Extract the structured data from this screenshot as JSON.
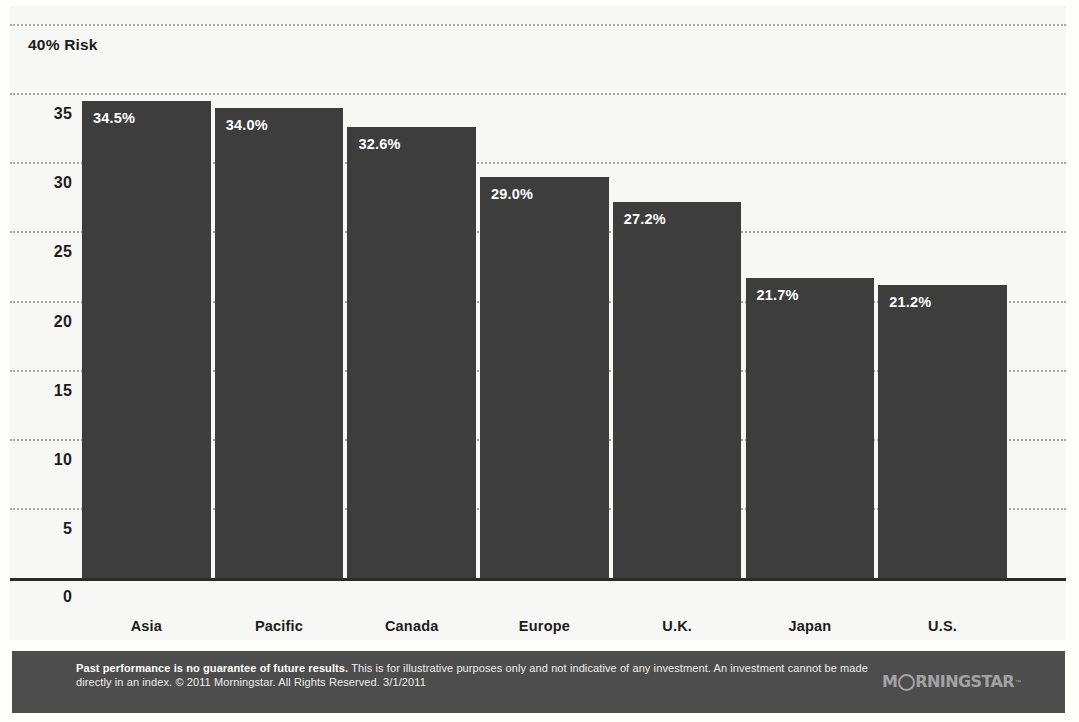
{
  "chart_data": {
    "type": "bar",
    "title": "",
    "subtitle": "",
    "axis_header_label": "40% Risk",
    "categories": [
      "Asia",
      "Pacific",
      "Canada",
      "Europe",
      "U.K.",
      "Japan",
      "U.S."
    ],
    "values": [
      34.5,
      34.0,
      32.6,
      29.0,
      27.2,
      21.7,
      21.2
    ],
    "value_labels": [
      "34.5%",
      "34.0%",
      "32.6%",
      "29.0%",
      "27.2%",
      "21.7%",
      "21.2%"
    ],
    "xlabel": "",
    "ylabel": "Risk",
    "ylim": [
      0,
      40
    ],
    "ytick_labels": [
      "0",
      "5",
      "10",
      "15",
      "20",
      "25",
      "30",
      "35"
    ],
    "ytick_values": [
      0,
      5,
      10,
      15,
      20,
      25,
      30,
      35
    ],
    "gridline_values": [
      5,
      10,
      15,
      20,
      25,
      30,
      35,
      40
    ],
    "grid": true,
    "grid_style": "dotted",
    "legend": false,
    "legend_position": "none",
    "orientation": "vertical",
    "bar_color": "#3d3d3d",
    "value_label_color": "#ffffff",
    "plot_background": "#f7f7f5",
    "gridline_color": "#a9a9a9",
    "axis_color": "#2b2b2b"
  },
  "footer": {
    "disclaimer_bold": "Past performance is no guarantee of future results.",
    "disclaimer_rest": " This is for illustrative purposes only and not indicative of any investment. An investment cannot be made directly in an index. © 2011 Morningstar. All Rights Reserved. 3/1/2011",
    "band_color": "#4d4d4d",
    "logo_prefix": "M",
    "logo_suffix": "RNINGSTAR",
    "logo_tm": "™"
  }
}
